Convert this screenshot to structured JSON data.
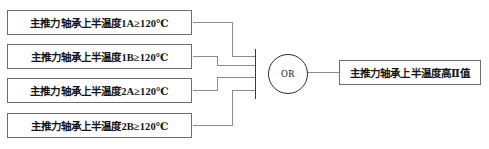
{
  "diagram": {
    "type": "logic-gate-diagram",
    "title": "",
    "gate": {
      "name": "or-gate",
      "label": "OR",
      "shape": "circle",
      "inputs": 4,
      "outputs": 1
    },
    "inputs": [
      {
        "id": "cond-1",
        "label": "主推力轴承上半温度1A≥120℃",
        "signal": "主推力轴承上半温度1A",
        "operator": "≥",
        "threshold": "120",
        "unit": "℃"
      },
      {
        "id": "cond-2",
        "label": "主推力轴承上半温度1B≥120℃",
        "signal": "主推力轴承上半温度1B",
        "operator": "≥",
        "threshold": "120",
        "unit": "℃"
      },
      {
        "id": "cond-3",
        "label": "主推力轴承上半温度2A≥120℃",
        "signal": "主推力轴承上半温度2A",
        "operator": "≥",
        "threshold": "120",
        "unit": "℃"
      },
      {
        "id": "cond-4",
        "label": "主推力轴承上半温度2B≥120℃",
        "signal": "主推力轴承上半温度2B",
        "operator": "≥",
        "threshold": "120",
        "unit": "℃"
      }
    ],
    "output": {
      "id": "out-1",
      "label": "主推力轴承上半温度高Ⅱ值"
    },
    "colors": {
      "box_border": "#6d6d6d",
      "gate_border": "#2b2b2b",
      "wire": "#8c8c8c",
      "bus": "#3a3a3a",
      "text": "#141414",
      "background": "#ffffff"
    }
  }
}
